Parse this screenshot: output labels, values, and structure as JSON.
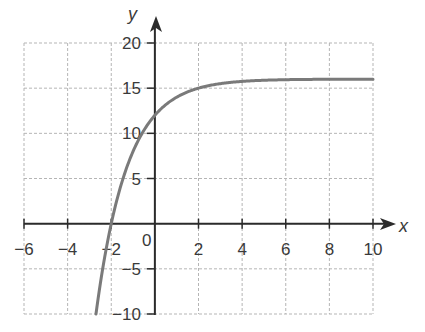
{
  "chart_data": {
    "type": "line",
    "title": "",
    "xlabel": "x",
    "ylabel": "y",
    "xlim": [
      -6,
      10
    ],
    "ylim": [
      -10,
      20
    ],
    "grid": true,
    "grid_style": "dashed",
    "x_ticks": [
      -6,
      -4,
      -2,
      2,
      4,
      6,
      8,
      10
    ],
    "x_tick_labels": [
      "-6",
      "-4",
      "-2",
      "2",
      "4",
      "6",
      "8",
      "10"
    ],
    "y_ticks": [
      20,
      15,
      10,
      5,
      -5,
      -10
    ],
    "y_tick_labels": [
      "20",
      "15",
      "10",
      "5",
      "-5",
      "-10"
    ],
    "origin_label": "0",
    "legend": null,
    "series": [
      {
        "name": "y = 16 - 4·2^(-x)",
        "color": "#7a7a7a",
        "x": [
          -2.7,
          -2.5,
          -2,
          -1.5,
          -1,
          -0.5,
          0,
          0.5,
          1,
          1.5,
          2,
          3,
          4,
          5,
          6,
          7,
          8,
          9,
          10
        ],
        "y": [
          -10.0,
          -6.6,
          0.0,
          4.7,
          8.0,
          10.3,
          12.0,
          13.2,
          14.0,
          14.6,
          15.0,
          15.5,
          15.75,
          15.88,
          15.94,
          15.97,
          15.98,
          15.99,
          16.0
        ]
      }
    ],
    "colors": {
      "axis": "#2b2b2b",
      "grid": "#b5b5b5",
      "curve": "#7a7a7a"
    }
  }
}
